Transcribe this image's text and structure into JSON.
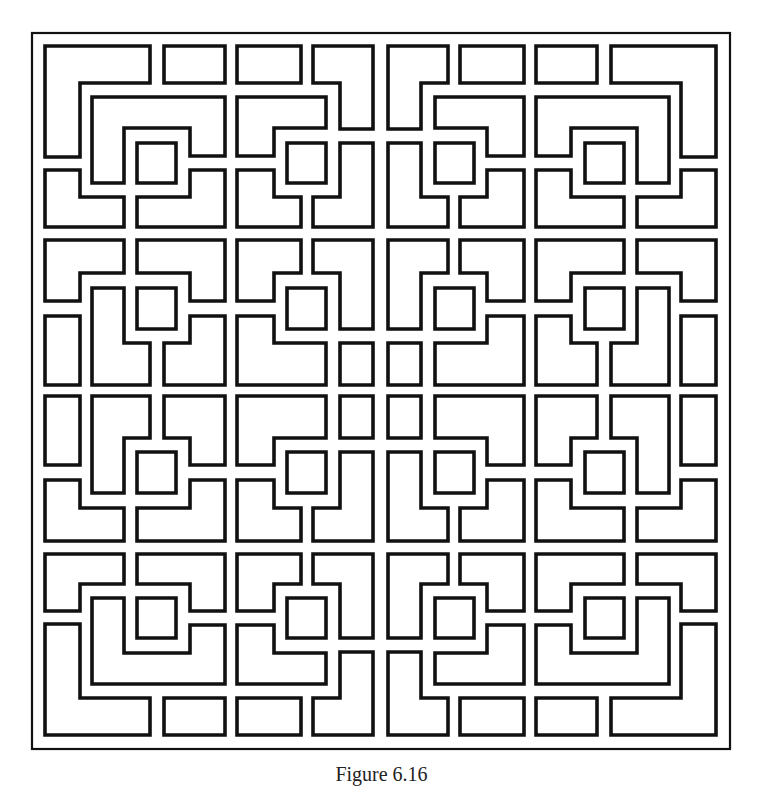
{
  "figure": {
    "type": "lattice-pattern",
    "stroke_color": "#111111",
    "background_color": "#ffffff",
    "frame": {
      "x": 32,
      "y": 33,
      "width": 698,
      "height": 716,
      "stroke_width": 2.2
    },
    "shape_stroke_width": 3.6,
    "mirror_center": {
      "x": 380.5,
      "y": 390.5
    },
    "quadrant_shapes": [
      {
        "name": "corner-l-shape",
        "points": "45,46 150,46 150,83 80,83 80,157 45,157"
      },
      {
        "name": "top-rect",
        "points": "164,46 225,46 225,83 164,83"
      },
      {
        "name": "c-shape",
        "points": "92,97 225,97 225,156 190,156 190,128 124,128 124,183 92,183"
      },
      {
        "name": "center-square",
        "points": "137,143 176,143 176,183 137,183"
      },
      {
        "name": "lower-left-l",
        "points": "45,170 80,170 80,197 124,197 124,227 45,227"
      },
      {
        "name": "lower-right-piece",
        "points": "137,197 190,197 190,170 225,170 225,227 137,227"
      },
      {
        "name": "top-rect-2",
        "points": "237,46 301,46 301,83 237,83"
      },
      {
        "name": "hook-l-shape",
        "points": "313,46 373,46 373,129 340,129 340,83 313,83"
      },
      {
        "name": "step-shape",
        "points": "237,97 326,97 326,128 274,128 274,156 237,156"
      },
      {
        "name": "center-square-2",
        "points": "287,143 326,143 326,183 287,183"
      },
      {
        "name": "lower-left-l-2",
        "points": "237,170 274,170 274,197 301,197 301,227 237,227"
      },
      {
        "name": "lower-right-l-2",
        "points": "313,197 340,197 340,143 373,143 373,227 313,227"
      },
      {
        "name": "row2-top-left",
        "points": "45,240 124,240 124,273 80,273 80,301 45,301"
      },
      {
        "name": "row2-top-right",
        "points": "137,240 225,240 225,301 190,301 190,273 137,273"
      },
      {
        "name": "row2-center-square",
        "points": "137,288 176,288 176,329 137,329"
      },
      {
        "name": "row2-left-rect",
        "points": "45,316 80,316 80,385 45,385"
      },
      {
        "name": "row2-middle-l",
        "points": "92,288 124,288 124,343 150,343 150,385 92,385"
      },
      {
        "name": "row2-right-piece",
        "points": "164,343 190,343 190,316 225,316 225,385 164,385"
      },
      {
        "name": "row2c2-top-left",
        "points": "237,240 301,240 301,273 274,273 274,301 237,301"
      },
      {
        "name": "row2c2-top-right-l",
        "points": "313,240 373,240 373,329 340,329 340,273 313,273"
      },
      {
        "name": "row2c2-center-square",
        "points": "287,288 326,288 326,329 287,329"
      },
      {
        "name": "row2c2-bottom-left",
        "points": "237,316 274,316 274,343 326,343 326,385 237,385"
      },
      {
        "name": "row2c2-small-square",
        "points": "340,343 373,343 373,385 340,385"
      }
    ]
  },
  "caption": {
    "text": "Figure 6.16",
    "visibility": "clipped at bottom edge"
  }
}
